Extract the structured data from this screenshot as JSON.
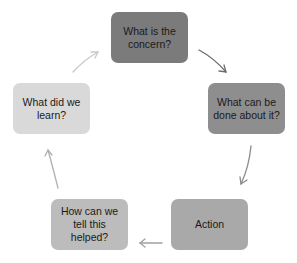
{
  "diagram": {
    "type": "cycle",
    "nodes": [
      {
        "id": "n1",
        "label": "What is the concern?",
        "color": "#7b7b7b"
      },
      {
        "id": "n2",
        "label": "What can be done about it?",
        "color": "#8e8e8e"
      },
      {
        "id": "n3",
        "label": "Action",
        "color": "#a9a9a9"
      },
      {
        "id": "n4",
        "label": "How can we tell this helped?",
        "color": "#bcbcbc"
      },
      {
        "id": "n5",
        "label": "What did we learn?",
        "color": "#d9d9d9"
      }
    ],
    "edges": [
      {
        "from": "n1",
        "to": "n2",
        "color": "#6e6e6e"
      },
      {
        "from": "n2",
        "to": "n3",
        "color": "#8a8a8a"
      },
      {
        "from": "n3",
        "to": "n4",
        "color": "#a0a0a0"
      },
      {
        "from": "n4",
        "to": "n5",
        "color": "#b0b0b0"
      },
      {
        "from": "n5",
        "to": "n1",
        "color": "#c8c8c8"
      }
    ]
  }
}
